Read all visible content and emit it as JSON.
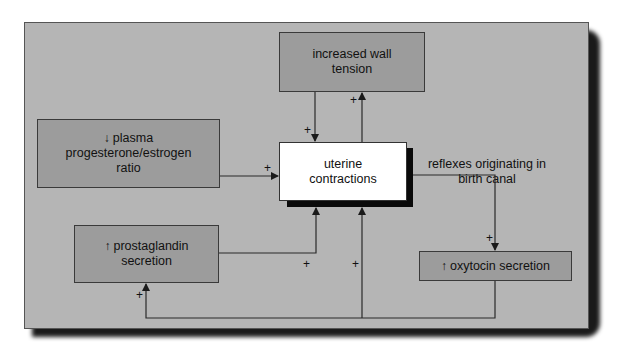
{
  "diagram": {
    "nodes": {
      "wall_tension": {
        "label": "increased wall tension",
        "line1": "increased wall",
        "line2": "tension"
      },
      "progesterone": {
        "arrow": "↓",
        "line1": "plasma",
        "line2": "progesterone/estrogen",
        "line3": "ratio"
      },
      "uterine": {
        "line1": "uterine",
        "line2": "contractions"
      },
      "prostaglandin": {
        "arrow": "↑",
        "line1": "prostaglandin",
        "line2": "secretion"
      },
      "oxytocin": {
        "arrow": "↑",
        "line1": "oxytocin secretion"
      }
    },
    "annotations": {
      "reflexes": {
        "line1": "reflexes originating in",
        "line2": "birth canal"
      }
    },
    "edges": [
      {
        "from": "progesterone",
        "to": "uterine",
        "sign": "+"
      },
      {
        "from": "wall_tension",
        "to": "uterine",
        "sign": "+"
      },
      {
        "from": "uterine",
        "to": "wall_tension",
        "sign": "+"
      },
      {
        "from": "uterine",
        "to": "oxytocin",
        "sign": "+",
        "via": "reflexes originating in birth canal"
      },
      {
        "from": "prostaglandin",
        "to": "uterine",
        "sign": "+"
      },
      {
        "from": "oxytocin",
        "to": "uterine",
        "sign": "+"
      },
      {
        "from": "oxytocin",
        "to": "prostaglandin",
        "sign": "+"
      }
    ],
    "sign_symbol": "+",
    "colors": {
      "panel": "#b5b5b5",
      "box": "#9c9c9c",
      "center_box": "#ffffff",
      "line": "#2a2a2a",
      "shadow": "#111111"
    }
  }
}
